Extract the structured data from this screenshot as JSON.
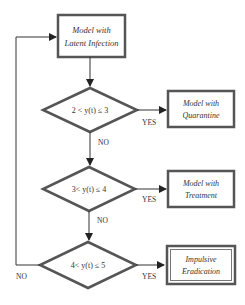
{
  "diagram": {
    "type": "flowchart",
    "nodes": {
      "latent": {
        "line1": "Model with",
        "line2": "Latent Infection"
      },
      "cond1": {
        "text": "2 < y(t) ≤ 3"
      },
      "quarantine": {
        "line1": "Model with",
        "line2": "Quarantine"
      },
      "cond2": {
        "text": "3< y(t) ≤ 4"
      },
      "treatment": {
        "line1": "Model with",
        "line2": "Treatment"
      },
      "cond3": {
        "text": "4< y(t) ≤ 5"
      },
      "eradication": {
        "line1": "Impulsive",
        "line2": "Eradication"
      }
    },
    "edge_labels": {
      "yes1": "YES",
      "no1": "NO",
      "yes2": "YES",
      "no2": "NO",
      "yes3": "YES",
      "no3": "NO"
    },
    "colors": {
      "stroke": "#555555",
      "text": "#333333",
      "background": "#ffffff"
    }
  }
}
